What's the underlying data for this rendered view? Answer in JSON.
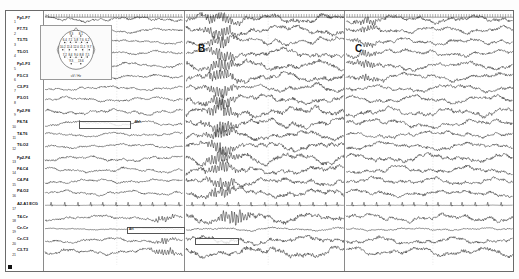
{
  "recording": {
    "title": "Multichannel EEG — bipolar longitudinal montage",
    "panel_labels": [
      "A",
      "B",
      "C"
    ],
    "row_numbers": [
      "1",
      "2",
      "3",
      "4",
      "5",
      "6",
      "7",
      "8",
      "9",
      "10",
      "11",
      "12",
      "13",
      "14",
      "15",
      "16",
      "17",
      "18",
      "19",
      "20",
      "21"
    ],
    "channels": [
      "Fp1-F7",
      "F7-T3",
      "T3-T5",
      "T5-O1",
      "Fp1-F3",
      "F3-C3",
      "C3-P3",
      "P3-O1",
      "Fp2-F8",
      "F8-T4",
      "T4-T6",
      "T6-O2",
      "Fp2-F4",
      "F4-C4",
      "C4-P4",
      "P4-O2",
      "A2-A1  ECG",
      "T4-Cz",
      "Cz-Cz",
      "Cz-C3",
      "C3-T3"
    ],
    "annotations": [
      {
        "id": "ann-eye-movement",
        "text": "Mvt",
        "panel": "A",
        "row": 9
      },
      {
        "id": "ann-artifact-low",
        "text": "Art",
        "panel": "A",
        "row": 18
      },
      {
        "id": "ann-burst-b",
        "text": "",
        "panel": "B",
        "row": 19
      }
    ],
    "scale": {
      "time_label": "1 sec",
      "amplitude_label": "70 uV",
      "sweep_speed": "30 mm/sec",
      "tick_interval_sec": 1
    }
  },
  "headmap": {
    "caption": "uV / Hz",
    "electrodes": [
      {
        "site": "Fp1",
        "value": "9.3"
      },
      {
        "site": "Fp2",
        "value": "8.1"
      },
      {
        "site": "F7",
        "value": "6.4"
      },
      {
        "site": "F3",
        "value": "7.1"
      },
      {
        "site": "Fz",
        "value": "5.8"
      },
      {
        "site": "F4",
        "value": "7.6"
      },
      {
        "site": "F8",
        "value": "6.2"
      },
      {
        "site": "T3",
        "value": "10.2"
      },
      {
        "site": "C3",
        "value": "11.4"
      },
      {
        "site": "Cz",
        "value": "12.0"
      },
      {
        "site": "C4",
        "value": "11.1"
      },
      {
        "site": "T4",
        "value": "9.7"
      },
      {
        "site": "T5",
        "value": "7.2"
      },
      {
        "site": "P3",
        "value": "8.4"
      },
      {
        "site": "Pz",
        "value": "9.0"
      },
      {
        "site": "P4",
        "value": "8.8"
      },
      {
        "site": "T6",
        "value": "7.5"
      },
      {
        "site": "O1",
        "value": "9.3"
      },
      {
        "site": "O2",
        "value": "13.6"
      }
    ]
  },
  "chart_data": {
    "type": "line",
    "xlabel": "Time (s)",
    "ylabel": "Channel (bipolar derivation)",
    "grid": false,
    "legend_position": "none",
    "panels": [
      {
        "label": "A",
        "x_range_sec": [
          0,
          10
        ]
      },
      {
        "label": "B",
        "x_range_sec": [
          10,
          20
        ]
      },
      {
        "label": "C",
        "x_range_sec": [
          20,
          30
        ]
      }
    ],
    "amplitude_units": "uV",
    "amplitude_scale_uV": 70,
    "sampling_note": "21 simultaneous traces, 10 s per panel",
    "series": [
      {
        "name": "Fp1-F7",
        "panelA_rms_uV": 18,
        "panelB_rms_uV": 34,
        "panelC_rms_uV": 27
      },
      {
        "name": "F7-T3",
        "panelA_rms_uV": 15,
        "panelB_rms_uV": 31,
        "panelC_rms_uV": 24
      },
      {
        "name": "T3-T5",
        "panelA_rms_uV": 13,
        "panelB_rms_uV": 29,
        "panelC_rms_uV": 22
      },
      {
        "name": "T5-O1",
        "panelA_rms_uV": 14,
        "panelB_rms_uV": 30,
        "panelC_rms_uV": 23
      },
      {
        "name": "Fp1-F3",
        "panelA_rms_uV": 17,
        "panelB_rms_uV": 33,
        "panelC_rms_uV": 26
      },
      {
        "name": "F3-C3",
        "panelA_rms_uV": 16,
        "panelB_rms_uV": 32,
        "panelC_rms_uV": 25
      },
      {
        "name": "C3-P3",
        "panelA_rms_uV": 14,
        "panelB_rms_uV": 28,
        "panelC_rms_uV": 23
      },
      {
        "name": "P3-O1",
        "panelA_rms_uV": 15,
        "panelB_rms_uV": 30,
        "panelC_rms_uV": 24
      },
      {
        "name": "Fp2-F8",
        "panelA_rms_uV": 19,
        "panelB_rms_uV": 36,
        "panelC_rms_uV": 28
      },
      {
        "name": "F8-T4",
        "panelA_rms_uV": 16,
        "panelB_rms_uV": 33,
        "panelC_rms_uV": 26
      },
      {
        "name": "T4-T6",
        "panelA_rms_uV": 13,
        "panelB_rms_uV": 29,
        "panelC_rms_uV": 22
      },
      {
        "name": "T6-O2",
        "panelA_rms_uV": 14,
        "panelB_rms_uV": 31,
        "panelC_rms_uV": 24
      },
      {
        "name": "Fp2-F4",
        "panelA_rms_uV": 18,
        "panelB_rms_uV": 35,
        "panelC_rms_uV": 27
      },
      {
        "name": "F4-C4",
        "panelA_rms_uV": 16,
        "panelB_rms_uV": 32,
        "panelC_rms_uV": 25
      },
      {
        "name": "C4-P4",
        "panelA_rms_uV": 14,
        "panelB_rms_uV": 29,
        "panelC_rms_uV": 23
      },
      {
        "name": "P4-O2",
        "panelA_rms_uV": 15,
        "panelB_rms_uV": 30,
        "panelC_rms_uV": 24
      },
      {
        "name": "A2-A1  ECG",
        "panelA_rms_uV": 6,
        "panelB_rms_uV": 7,
        "panelC_rms_uV": 6
      },
      {
        "name": "T4-Cz",
        "panelA_rms_uV": 17,
        "panelB_rms_uV": 34,
        "panelC_rms_uV": 26
      },
      {
        "name": "Cz-Cz",
        "panelA_rms_uV": 12,
        "panelB_rms_uV": 26,
        "panelC_rms_uV": 21
      },
      {
        "name": "Cz-C3",
        "panelA_rms_uV": 15,
        "panelB_rms_uV": 31,
        "panelC_rms_uV": 24
      },
      {
        "name": "C3-T3",
        "panelA_rms_uV": 20,
        "panelB_rms_uV": 37,
        "panelC_rms_uV": 29
      }
    ]
  }
}
